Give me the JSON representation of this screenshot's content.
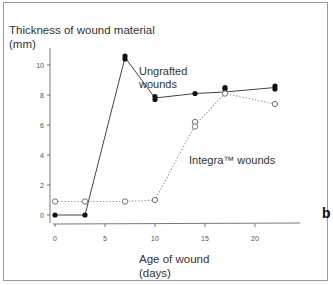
{
  "chart_data": {
    "type": "line",
    "title": "",
    "panel_label": "b",
    "xlabel": "Age of wound (days)",
    "ylabel": "Thickness of wound material (mm)",
    "xlim": [
      0,
      24
    ],
    "ylim": [
      0,
      11
    ],
    "x_ticks": [
      0,
      5,
      10,
      15,
      20
    ],
    "y_ticks": [
      0,
      2,
      4,
      6,
      8,
      10
    ],
    "grid": false,
    "series": [
      {
        "name": "Ungrafted wounds",
        "marker": "filled-circle",
        "line": "solid",
        "points": [
          [
            0,
            0.0
          ],
          [
            3,
            0.0
          ],
          [
            7,
            10.6
          ],
          [
            7,
            10.4
          ],
          [
            10,
            7.9
          ],
          [
            10,
            7.7
          ],
          [
            14,
            8.1
          ],
          [
            17,
            8.5
          ],
          [
            17,
            8.4
          ],
          [
            22,
            8.6
          ],
          [
            22,
            8.4
          ]
        ],
        "mean_line": [
          [
            0,
            0.0
          ],
          [
            3,
            0.0
          ],
          [
            7,
            10.5
          ],
          [
            10,
            7.8
          ],
          [
            14,
            8.1
          ],
          [
            17,
            8.2
          ],
          [
            22,
            8.5
          ]
        ]
      },
      {
        "name": "Integra™ wounds",
        "marker": "open-circle",
        "line": "dotted",
        "points": [
          [
            0,
            0.9
          ],
          [
            3,
            0.9
          ],
          [
            7,
            0.9
          ],
          [
            10,
            1.0
          ],
          [
            14,
            6.2
          ],
          [
            14,
            5.9
          ],
          [
            17,
            8.1
          ],
          [
            22,
            7.4
          ]
        ],
        "mean_line": [
          [
            0,
            0.9
          ],
          [
            3,
            0.9
          ],
          [
            7,
            0.9
          ],
          [
            10,
            1.0
          ],
          [
            14,
            6.0
          ],
          [
            17,
            8.1
          ],
          [
            22,
            7.4
          ]
        ]
      }
    ],
    "annotations": [
      {
        "text_line1": "Ungrafted",
        "text_line2": "wounds"
      },
      {
        "text": "Integra™ wounds"
      }
    ]
  },
  "labels": {
    "ytitle_line1": "Thickness of wound material",
    "ytitle_line2": "(mm)",
    "xtitle_line1": "Age of wound",
    "xtitle_line2": "(days)",
    "panel": "b",
    "ann_ungrafted_1": "Ungrafted",
    "ann_ungrafted_2": "wounds",
    "ann_integra": "Integra™ wounds"
  }
}
